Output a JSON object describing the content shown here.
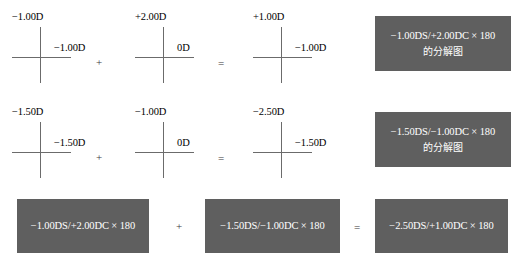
{
  "diagram": {
    "title_hidden": "",
    "colors": {
      "box_fill": "#5f5f5f",
      "box_text": "#ffffff",
      "cross_line": "#6b6b6b",
      "label_text": "#000000",
      "background": "#ffffff"
    }
  },
  "rows": [
    {
      "crosses": [
        {
          "vertical_power": "−1.00D",
          "horizontal_power": "−1.00D"
        },
        {
          "vertical_power": "+2.00D",
          "horizontal_power": "0D"
        },
        {
          "vertical_power": "+1.00D",
          "horizontal_power": "−1.00D"
        }
      ],
      "operators": {
        "plus": "+",
        "equals": "="
      },
      "result_box": {
        "line1": "−1.00DS/+2.00DC × 180",
        "line2": "的分解图"
      }
    },
    {
      "crosses": [
        {
          "vertical_power": "−1.50D",
          "horizontal_power": "−1.50D"
        },
        {
          "vertical_power": "−1.00D",
          "horizontal_power": "0D"
        },
        {
          "vertical_power": "−2.50D",
          "horizontal_power": "−1.50D"
        }
      ],
      "operators": {
        "plus": "+",
        "equals": "="
      },
      "result_box": {
        "line1": "−1.50DS/−1.00DC × 180",
        "line2": "的分解图"
      }
    }
  ],
  "summary": {
    "box_left": "−1.00DS/+2.00DC × 180",
    "operator_plus": "+",
    "box_middle": "−1.50DS/−1.00DC × 180",
    "operator_equals": "=",
    "box_right": "−2.50DS/+1.00DC × 180"
  }
}
